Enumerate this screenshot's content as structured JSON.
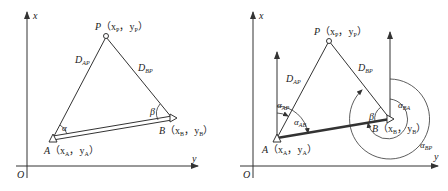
{
  "left_diagram": {
    "axis_x_label": "x",
    "axis_y_label": "y",
    "origin_label": "O",
    "point_P": {
      "name": "P",
      "coords": "（x",
      "sub1": "P",
      "sep": "，y",
      "sub2": "P",
      "close": "）"
    },
    "point_A": {
      "name": "A",
      "coords": "（x",
      "sub1": "A",
      "sep": "，y",
      "sub2": "A",
      "close": "）"
    },
    "point_B": {
      "name": "B",
      "coords": "（x",
      "sub1": "B",
      "sep": "，y",
      "sub2": "B",
      "close": "）"
    },
    "side_AP": {
      "base": "D",
      "sub": "AP"
    },
    "side_BP": {
      "base": "D",
      "sub": "BP"
    },
    "angle_alpha": "α",
    "angle_beta": "β"
  },
  "right_diagram": {
    "axis_x_label": "x",
    "axis_y_label": "y",
    "origin_label": "O",
    "point_P": {
      "name": "P",
      "coords": "（x",
      "sub1": "P",
      "sep": "，y",
      "sub2": "P",
      "close": "）"
    },
    "point_A": {
      "name": "A",
      "coords": "（x",
      "sub1": "A",
      "sep": "，y",
      "sub2": "A",
      "close": "）"
    },
    "point_B": {
      "name": "B",
      "coords": "（x",
      "sub1": "B",
      "sep": "，y",
      "sub2": "B",
      "close": "）"
    },
    "side_AP": {
      "base": "D",
      "sub": "AP"
    },
    "side_BP": {
      "base": "D",
      "sub": "BP"
    },
    "angle_AP": {
      "base": "α",
      "sub": "AP"
    },
    "angle_AB": {
      "base": "α",
      "sub": "AB"
    },
    "angle_BA": {
      "base": "α",
      "sub": "BA"
    },
    "angle_BP": {
      "base": "α",
      "sub": "BP"
    },
    "angle_beta": "β"
  },
  "colors": {
    "line": "#333333",
    "background": "#ffffff"
  }
}
